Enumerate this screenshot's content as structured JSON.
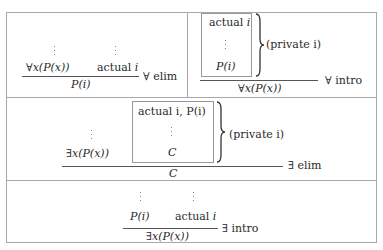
{
  "panels": {
    "forall_elim": {
      "premise_left": "∀x(P(x))",
      "premise_right_word": "actual",
      "premise_right_var": "i",
      "conclusion": "P(i)",
      "rule_label": "∀ elim"
    },
    "forall_intro": {
      "box_top_word": "actual",
      "box_top_var": "i",
      "box_bottom": "P(i)",
      "brace_label": "(private i)",
      "conclusion": "∀x(P(x))",
      "rule_label": "∀ intro"
    },
    "exists_elim": {
      "premise_left": "∃x(P(x))",
      "box_top": "actual i,  P(i)",
      "box_bottom": "C",
      "brace_label": "(private i)",
      "conclusion": "C",
      "rule_label": "∃ elim"
    },
    "exists_intro": {
      "premise_left": "P(i)",
      "premise_right_word": "actual",
      "premise_right_var": "i",
      "conclusion": "∃x(P(x))",
      "rule_label": "∃ intro"
    }
  },
  "colors": {
    "border": "#a8a8a8",
    "text": "#2a2a2a",
    "rule": "#555555"
  }
}
